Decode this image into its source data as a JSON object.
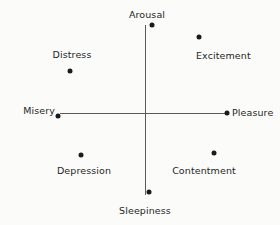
{
  "figure": {
    "title": "",
    "background_color": "#fbfbfa",
    "axis_color": "#5a5a5a",
    "point_color": "#1a1a1a",
    "text_color": "#262626"
  },
  "chart_data": {
    "type": "scatter",
    "title": "",
    "subtitle": "",
    "xlabel": "",
    "ylabel": "",
    "xlim": [
      -1,
      1
    ],
    "ylim": [
      -1,
      1
    ],
    "grid": false,
    "legend": "none",
    "axes": {
      "horizontal": {
        "negative_label": "Misery",
        "positive_label": "Pleasure",
        "x_start_px": 60,
        "x_end_px": 228,
        "y_px": 113
      },
      "vertical": {
        "positive_label": "Arousal",
        "negative_label": "Sleepiness",
        "y_start_px": 25,
        "y_end_px": 195,
        "x_px": 145
      }
    },
    "points": [
      {
        "label": "Arousal",
        "x": 0.05,
        "y": 1.0,
        "px": 152,
        "py": 25,
        "label_x": 147,
        "label_y": 9,
        "label_align": "c"
      },
      {
        "label": "Excitement",
        "x": 0.62,
        "y": 0.86,
        "px": 199,
        "py": 37,
        "label_x": 196,
        "label_y": 50,
        "label_align": "l"
      },
      {
        "label": "Distress",
        "x": -0.88,
        "y": 0.48,
        "px": 70,
        "py": 71,
        "label_x": 72,
        "label_y": 49,
        "label_align": "c"
      },
      {
        "label": "Misery",
        "x": -1.0,
        "y": 0.0,
        "px": 58,
        "py": 116,
        "label_x": 55,
        "label_y": 105,
        "label_align": "r"
      },
      {
        "label": "Pleasure",
        "x": 1.0,
        "y": 0.0,
        "px": 227,
        "py": 113,
        "label_x": 232,
        "label_y": 107,
        "label_align": "l"
      },
      {
        "label": "Depression",
        "x": -0.75,
        "y": -0.48,
        "px": 81,
        "py": 155,
        "label_x": 84,
        "label_y": 165,
        "label_align": "c"
      },
      {
        "label": "Contentment",
        "x": 0.8,
        "y": -0.46,
        "px": 214,
        "py": 153,
        "label_x": 204,
        "label_y": 165,
        "label_align": "c"
      },
      {
        "label": "Sleepiness",
        "x": 0.03,
        "y": -1.0,
        "px": 149,
        "py": 192,
        "label_x": 145,
        "label_y": 205,
        "label_align": "c"
      }
    ]
  }
}
